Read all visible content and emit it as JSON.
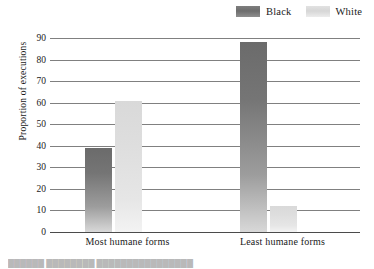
{
  "chart_data": {
    "type": "bar",
    "title": "",
    "xlabel": "",
    "ylabel": "Proportion of executions",
    "categories": [
      "Most humane forms",
      "Least humane forms"
    ],
    "series": [
      {
        "name": "Black",
        "values": [
          39,
          88
        ],
        "color": "#6d6d6d"
      },
      {
        "name": "White",
        "values": [
          61,
          12
        ],
        "color": "#dedede"
      }
    ],
    "ylim": [
      0,
      90
    ],
    "ytick_step": 10,
    "yticks": [
      0,
      10,
      20,
      30,
      40,
      50,
      60,
      70,
      80,
      90
    ],
    "ytick_labels": [
      "0",
      "10",
      "20",
      "30",
      "40",
      "50",
      "60",
      "70",
      "80",
      "90"
    ],
    "grid": true,
    "legend_position": "top-right"
  },
  "legend": {
    "entries": [
      {
        "label": "Black",
        "swatch": "legend-swatch-black"
      },
      {
        "label": "White",
        "swatch": "legend-swatch-white"
      }
    ]
  },
  "caption": {
    "text": "██████ ████████ ████████████████"
  }
}
